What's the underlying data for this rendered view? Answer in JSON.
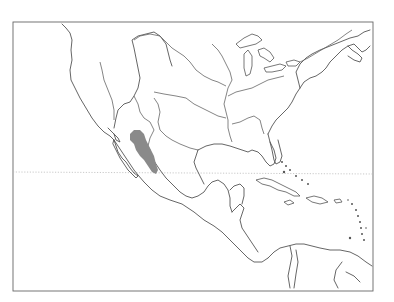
{
  "map": {
    "type": "species-range-map",
    "region": "North America, Central America and Caribbean",
    "frame": {
      "x": 13,
      "y": 22,
      "width": 360,
      "height": 269
    },
    "colors": {
      "background": "#ffffff",
      "outline": "#555555",
      "range_fill": "#8a8a8a",
      "tropic_line": "#bbbbbb"
    },
    "range": {
      "label": "",
      "description": "Shaded distribution area along the Sierra Madre Occidental, western Mexico"
    },
    "reference_lines": [
      {
        "name": "tropic-of-cancer",
        "style": "dotted",
        "y": 172
      }
    ]
  }
}
